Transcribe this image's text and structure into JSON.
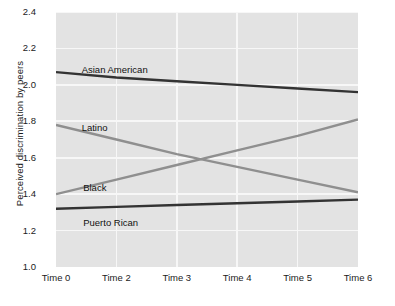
{
  "chart_data": {
    "type": "line",
    "title": "",
    "xlabel": "",
    "ylabel": "Perceived discrimination by peers",
    "x_tick_labels": [
      "Time 0",
      "Time 2",
      "Time 3",
      "Time 4",
      "Time 5",
      "Time 6"
    ],
    "y_tick_labels": [
      "1.0",
      "1.2",
      "1.4",
      "1.6",
      "1.8",
      "2.0",
      "2.2",
      "2.4"
    ],
    "ylim": [
      1.0,
      2.4
    ],
    "y_ticks": [
      1.0,
      1.2,
      1.4,
      1.6,
      1.8,
      2.0,
      2.2,
      2.4
    ],
    "grid": "both",
    "legend_position": "inline-labels",
    "x": [
      0,
      2,
      3,
      4,
      5,
      6
    ],
    "series": [
      {
        "name": "Asian American",
        "color": "#333333",
        "values": [
          2.07,
          2.04,
          2.02,
          2.0,
          1.98,
          1.96
        ],
        "label_x_pct": 8.5,
        "label_y_pct": 20.5
      },
      {
        "name": "Latino",
        "color": "#8f8f8f",
        "values": [
          1.78,
          1.7,
          1.62,
          1.55,
          1.48,
          1.41
        ],
        "label_x_pct": 8.5,
        "label_y_pct": 43.0
      },
      {
        "name": "Black",
        "color": "#8f8f8f",
        "values": [
          1.4,
          1.48,
          1.56,
          1.64,
          1.72,
          1.81
        ],
        "label_x_pct": 9.0,
        "label_y_pct": 66.5
      },
      {
        "name": "Puerto Rican",
        "color": "#333333",
        "values": [
          1.32,
          1.33,
          1.34,
          1.35,
          1.36,
          1.37
        ],
        "label_x_pct": 9.0,
        "label_y_pct": 80.5
      }
    ],
    "plot_background": "#e3e3e3",
    "gridline_color": "#f7f7f7",
    "page_background": "#ffffff"
  }
}
